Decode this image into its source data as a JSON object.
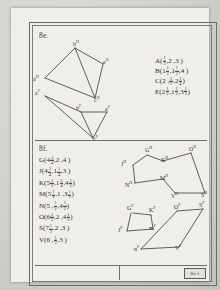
{
  "document": {
    "kind": "worksheet-scan",
    "stamp_label": "8a-f"
  },
  "panels": [
    {
      "id": "e",
      "label": "8e.",
      "coordinates": [
        {
          "letter": "A(",
          "parts": [
            {
              "t": "frac",
              "n": "1",
              "d": "2"
            },
            {
              "t": "text",
              "v": ",2 ,3 )"
            }
          ]
        },
        {
          "letter": "B(",
          "parts": [
            {
              "t": "mixed",
              "w": "1",
              "n": "1",
              "d": "2"
            },
            {
              "t": "text",
              "v": ","
            },
            {
              "t": "mixed",
              "w": "1",
              "n": "1",
              "d": "2"
            },
            {
              "t": "text",
              "v": ",4 )"
            }
          ]
        },
        {
          "letter": "C(",
          "parts": [
            {
              "t": "text",
              "v": "2 , "
            },
            {
              "t": "frac",
              "n": "1",
              "d": "2"
            },
            {
              "t": "text",
              "v": ","
            },
            {
              "t": "mixed",
              "w": "2",
              "n": "1",
              "d": "4"
            },
            {
              "t": "text",
              "v": ")"
            }
          ]
        },
        {
          "letter": "E(",
          "parts": [
            {
              "t": "mixed",
              "w": "2",
              "n": "1",
              "d": "2"
            },
            {
              "t": "text",
              "v": ","
            },
            {
              "t": "mixed",
              "w": "1",
              "n": "1",
              "d": "2"
            },
            {
              "t": "text",
              "v": ",3"
            },
            {
              "t": "frac",
              "n": "1",
              "d": "2"
            },
            {
              "t": "text",
              "v": ")"
            }
          ]
        }
      ],
      "figures": [
        {
          "name": "tetrahedron-image",
          "superscript": "H",
          "vertices": [
            "b",
            "a",
            "e",
            "c"
          ]
        },
        {
          "name": "tetrahedron-preimage",
          "superscript": "F",
          "vertices": [
            "a",
            "b",
            "e",
            "c"
          ]
        }
      ]
    },
    {
      "id": "f",
      "label": "8f.",
      "coordinates": [
        {
          "letter": "G(",
          "parts": [
            {
              "t": "mixed",
              "w": "4",
              "n": "3",
              "d": "4"
            },
            {
              "t": "text",
              "v": ",2 ,4 )"
            }
          ]
        },
        {
          "letter": "J(",
          "parts": [
            {
              "t": "mixed",
              "w": "4",
              "n": "3",
              "d": "4"
            },
            {
              "t": "text",
              "v": ","
            },
            {
              "t": "mixed",
              "w": "1",
              "n": "1",
              "d": "4"
            },
            {
              "t": "text",
              "v": ",3 )"
            }
          ]
        },
        {
          "letter": "K(",
          "parts": [
            {
              "t": "mixed",
              "w": "5",
              "n": "1",
              "d": "2"
            },
            {
              "t": "text",
              "v": ","
            },
            {
              "t": "mixed",
              "w": "1",
              "n": "3",
              "d": "4"
            },
            {
              "t": "text",
              "v": ","
            },
            {
              "t": "mixed",
              "w": "4",
              "n": "1",
              "d": "2"
            },
            {
              "t": "text",
              "v": ")"
            }
          ]
        },
        {
          "letter": "M(",
          "parts": [
            {
              "t": "mixed",
              "w": "5",
              "n": "1",
              "d": "2"
            },
            {
              "t": "text",
              "v": ",1 ,3"
            },
            {
              "t": "frac",
              "n": "1",
              "d": "2"
            },
            {
              "t": "text",
              "v": ")"
            }
          ]
        },
        {
          "letter": "N(",
          "parts": [
            {
              "t": "text",
              "v": "5 , "
            },
            {
              "t": "frac",
              "n": "1",
              "d": "2"
            },
            {
              "t": "text",
              "v": ","
            },
            {
              "t": "mixed",
              "w": "4",
              "n": "1",
              "d": "2"
            },
            {
              "t": "text",
              "v": ")"
            }
          ]
        },
        {
          "letter": "O(",
          "parts": [
            {
              "t": "mixed",
              "w": "6",
              "n": "1",
              "d": "2"
            },
            {
              "t": "text",
              "v": ",2 ,"
            },
            {
              "t": "mixed",
              "w": "4",
              "n": "1",
              "d": "2"
            },
            {
              "t": "text",
              "v": ")"
            }
          ]
        },
        {
          "letter": "S(",
          "parts": [
            {
              "t": "mixed",
              "w": "7",
              "n": "1",
              "d": "2"
            },
            {
              "t": "text",
              "v": ",2 ,3 )"
            }
          ]
        },
        {
          "letter": "V(",
          "parts": [
            {
              "t": "text",
              "v": "6 , "
            },
            {
              "t": "frac",
              "n": "1",
              "d": "2"
            },
            {
              "t": "text",
              "v": ",3 )"
            }
          ]
        }
      ],
      "figures": [
        {
          "name": "polygon-image",
          "superscript": "H",
          "vertices": [
            "O",
            "G",
            "K",
            "M",
            "J",
            "N",
            "V",
            "S"
          ]
        },
        {
          "name": "polygon-preimage",
          "superscript": "F",
          "vertices": [
            "G",
            "K",
            "M",
            "J",
            "N",
            "V",
            "O",
            "S"
          ]
        }
      ]
    }
  ]
}
